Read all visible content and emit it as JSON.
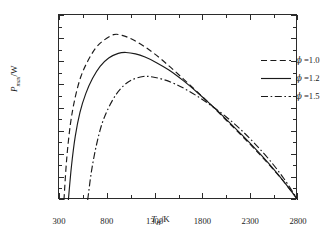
{
  "chart_data": {
    "type": "line",
    "title": "",
    "xlabel": "T_H/K",
    "ylabel": "P_max/W",
    "xlabel_parts": {
      "symbol": "T",
      "sub": "H",
      "unit": "/K"
    },
    "ylabel_parts": {
      "symbol": "P",
      "sub": "max",
      "unit": "/W"
    },
    "xlim": [
      300,
      2800
    ],
    "ylim": [
      0,
      80000
    ],
    "grid": false,
    "legend_position": "top-right-inside",
    "x_ticks": [
      300,
      800,
      1300,
      1800,
      2300,
      2800
    ],
    "x_tick_labels": [
      "300",
      "800",
      "1300",
      "1800",
      "2300",
      "2800"
    ],
    "x_minor_ticks": [
      550,
      1050,
      1550,
      2050,
      2550
    ],
    "y_ticks": [
      0,
      10000,
      20000,
      30000,
      40000,
      50000,
      60000,
      70000,
      80000
    ],
    "y_tick_labels": [
      "0",
      "1×10⁴",
      "2×10⁴",
      "3×10⁴",
      "4×10⁴",
      "5×10⁴",
      "6×10⁴",
      "7×10⁴",
      "8×10⁴"
    ],
    "y_tick_mantissas": [
      "0",
      "1",
      "2",
      "3",
      "4",
      "5",
      "6",
      "7",
      "8"
    ],
    "y_minor_ticks": [
      5000,
      15000,
      25000,
      35000,
      45000,
      55000,
      65000,
      75000
    ],
    "series": [
      {
        "name": "φ =1.0",
        "legend_label": "=1.0",
        "symbol": "ϕ",
        "dash": "dashed",
        "color": "#1a1a1a",
        "peak": {
          "x": 870,
          "y": 71500
        },
        "x_intercepts": [
          352,
          2800
        ],
        "x": [
          352,
          380,
          420,
          470,
          530,
          600,
          680,
          760,
          870,
          960,
          1060,
          1180,
          1300,
          1450,
          1600,
          1750,
          1900,
          2050,
          2200,
          2350,
          2500,
          2650,
          2800
        ],
        "y": [
          0,
          17500,
          33000,
          44500,
          53500,
          60000,
          65500,
          68800,
          71500,
          71200,
          69600,
          66700,
          63200,
          58000,
          52400,
          46600,
          40700,
          34500,
          28300,
          21900,
          15200,
          8000,
          0
        ]
      },
      {
        "name": "φ =1.2",
        "legend_label": "=1.2",
        "symbol": "ϕ",
        "dash": "solid",
        "color": "#1a1a1a",
        "peak": {
          "x": 1000,
          "y": 63800
        },
        "x_intercepts": [
          398,
          2800
        ],
        "x": [
          398,
          430,
          470,
          520,
          580,
          650,
          730,
          820,
          920,
          1000,
          1100,
          1200,
          1320,
          1450,
          1600,
          1750,
          1900,
          2050,
          2200,
          2350,
          2500,
          2650,
          2800
        ],
        "y": [
          0,
          14500,
          27500,
          38000,
          46000,
          52500,
          57800,
          61400,
          63400,
          63800,
          63200,
          61800,
          59400,
          56200,
          51600,
          46400,
          40800,
          34900,
          28700,
          22300,
          15500,
          8100,
          0
        ]
      },
      {
        "name": "φ =1.5",
        "legend_label": "=1.5",
        "symbol": "ϕ",
        "dash": "dashdot",
        "color": "#1a1a1a",
        "peak": {
          "x": 1180,
          "y": 53400
        },
        "x_intercepts": [
          600,
          2800
        ],
        "x": [
          600,
          640,
          690,
          750,
          820,
          900,
          980,
          1060,
          1180,
          1280,
          1400,
          1520,
          1650,
          1780,
          1900,
          2050,
          2200,
          2350,
          2500,
          2650,
          2800
        ],
        "y": [
          0,
          12500,
          23500,
          33000,
          40000,
          45800,
          49600,
          51900,
          53400,
          53200,
          52000,
          50100,
          47300,
          44000,
          40600,
          35900,
          30500,
          24300,
          17400,
          9400,
          0
        ]
      }
    ]
  }
}
